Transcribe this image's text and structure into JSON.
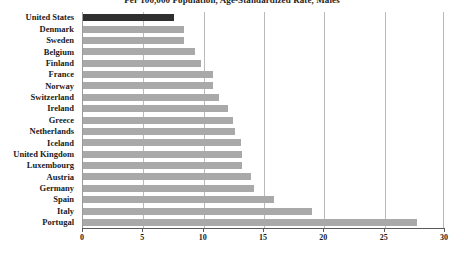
{
  "chart_data": {
    "type": "bar",
    "orientation": "horizontal",
    "title": "Per 100,000 Population, Age-Standardized Rate, Males",
    "xlabel": "",
    "ylabel": "",
    "xlim": [
      0,
      30
    ],
    "xticks": [
      0,
      5,
      10,
      15,
      20,
      25,
      30
    ],
    "xtick_labels": [
      "0",
      "5",
      "10",
      "15",
      "20",
      "25",
      "30"
    ],
    "grid": true,
    "grid_axis": "x",
    "legend": "none",
    "highlight_category": "United States",
    "colors": {
      "highlight_bar": "#2f2f2f",
      "bar": "#a9a9a9",
      "gridline": "#b9b9b9",
      "axis": "#5a5a5a",
      "text": "#1a1a1a",
      "background": "#ffffff"
    },
    "categories": [
      "United States",
      "Denmark",
      "Sweden",
      "Belgium",
      "Finland",
      "France",
      "Norway",
      "Switzerland",
      "Ireland",
      "Greece",
      "Netherlands",
      "Iceland",
      "United Kingdom",
      "Luxembourg",
      "Austria",
      "Germany",
      "Spain",
      "Italy",
      "Portugal"
    ],
    "values": [
      7.5,
      8.4,
      8.4,
      9.3,
      9.8,
      10.8,
      10.8,
      11.3,
      12.0,
      12.4,
      12.6,
      13.1,
      13.2,
      13.2,
      13.9,
      14.2,
      15.8,
      19.0,
      27.7
    ]
  }
}
